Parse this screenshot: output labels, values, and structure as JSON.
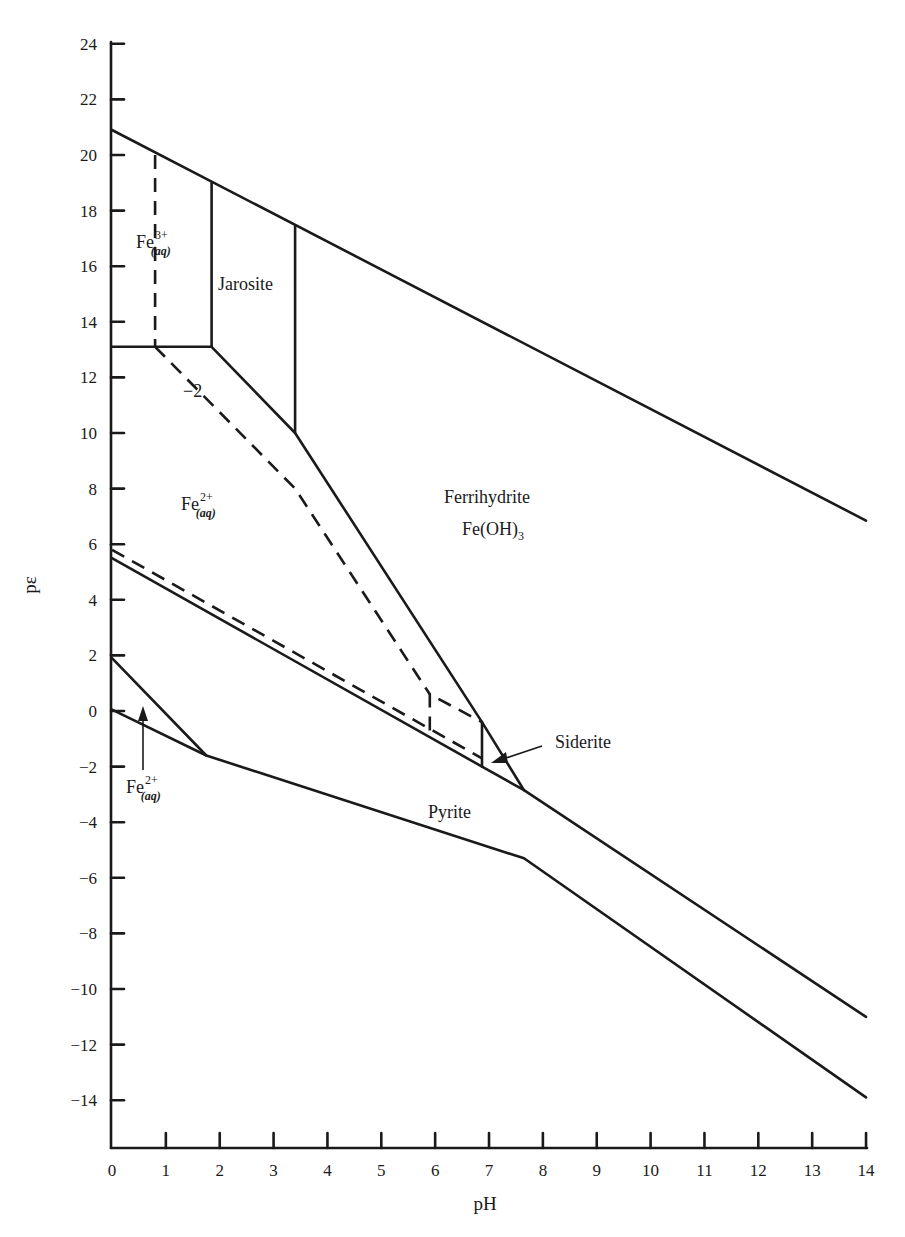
{
  "chart_data": {
    "type": "line",
    "title": "",
    "xlabel": "pH",
    "ylabel": "pε",
    "xlim": [
      0,
      14
    ],
    "ylim": [
      -16,
      24
    ],
    "x_ticks": [
      0,
      1,
      2,
      3,
      4,
      5,
      6,
      7,
      8,
      9,
      10,
      11,
      12,
      13,
      14
    ],
    "x_tick_labels": [
      "0",
      "1",
      "2",
      "3",
      "4",
      "5",
      "6",
      "7",
      "8",
      "9",
      "10",
      "11",
      "12",
      "13",
      "14"
    ],
    "y_ticks": [
      24,
      22,
      20,
      18,
      16,
      14,
      12,
      10,
      8,
      6,
      4,
      2,
      0,
      -2,
      -4,
      -6,
      -8,
      -10,
      -12,
      -14
    ],
    "y_tick_labels": [
      "24",
      "22",
      "20",
      "18",
      "16",
      "14",
      "12",
      "10",
      "8",
      "6",
      "4",
      "2",
      "0",
      "−2",
      "−4",
      "−6",
      "−8",
      "−10",
      "−12",
      "−14"
    ],
    "grid": false,
    "legend": null,
    "series": [
      {
        "name": "Upper water stability limit",
        "style": "solid",
        "x": [
          0,
          14
        ],
        "y": [
          20.9,
          6.85
        ]
      },
      {
        "name": "Lower water stability limit",
        "style": "solid",
        "x": [
          0,
          1.75,
          7.65,
          14
        ],
        "y": [
          0.05,
          -1.6,
          -5.3,
          -13.9
        ]
      },
      {
        "name": "Fe3+/Fe2+ boundary",
        "style": "solid",
        "x": [
          0,
          1.85
        ],
        "y": [
          13.1,
          13.1
        ]
      },
      {
        "name": "Fe3+/Jarosite boundary",
        "style": "solid",
        "x": [
          1.85,
          1.85
        ],
        "y": [
          19.0,
          13.1
        ]
      },
      {
        "name": "Jarosite/Ferrihydrite boundary",
        "style": "solid",
        "x": [
          3.4,
          3.4
        ],
        "y": [
          17.45,
          10.0
        ]
      },
      {
        "name": "Fe2+/Jarosite-Ferrihydrite boundary",
        "style": "solid",
        "x": [
          1.85,
          3.4,
          6.87,
          7.65
        ],
        "y": [
          13.1,
          10.0,
          -0.4,
          -2.85
        ]
      },
      {
        "name": "Fe2+/Pyrite boundary",
        "style": "solid",
        "x": [
          0,
          6.87,
          7.65,
          14
        ],
        "y": [
          5.5,
          -2.0,
          -2.85,
          -11.0
        ]
      },
      {
        "name": "Siderite boundary",
        "style": "solid",
        "x": [
          6.87,
          6.87
        ],
        "y": [
          -0.4,
          -2.0
        ]
      },
      {
        "name": "Pyrite/Fe2+ lower region",
        "style": "solid",
        "x": [
          0,
          1.75
        ],
        "y": [
          1.9,
          -1.6
        ]
      },
      {
        "name": "Fe3+ boundary (dashed, log=−2)",
        "style": "dashed",
        "x": [
          0.8,
          0.8
        ],
        "y": [
          20.0,
          13.1
        ]
      },
      {
        "name": "Fe2+/Ferrihydrite (dashed, log=−2)",
        "style": "dashed",
        "x": [
          0.8,
          3.4,
          5.9
        ],
        "y": [
          13.1,
          8.0,
          0.6
        ]
      },
      {
        "name": "Siderite dashed",
        "style": "dashed",
        "x": [
          5.9,
          5.9,
          6.87
        ],
        "y": [
          -0.7,
          0.6,
          -0.4
        ]
      },
      {
        "name": "Fe2+/Pyrite (dashed)",
        "style": "dashed",
        "x": [
          0,
          6.87
        ],
        "y": [
          5.8,
          -1.7
        ]
      }
    ],
    "annotations": [
      {
        "text": "Fe3+(aq)",
        "x": 0.75,
        "y": 16.6
      },
      {
        "text": "Jarosite",
        "x": 2.6,
        "y": 15.2
      },
      {
        "text": "−2",
        "x": 1.65,
        "y": 11.3
      },
      {
        "text": "Fe2+(aq)",
        "x": 1.85,
        "y": 7.0
      },
      {
        "text": "Ferrihydrite Fe(OH)3",
        "x": 7.5,
        "y": 7.2
      },
      {
        "text": "Siderite",
        "x": 8.5,
        "y": -1.1,
        "arrow_to": [
          7.05,
          -2.0
        ]
      },
      {
        "text": "Pyrite",
        "x": 6.3,
        "y": -3.7
      },
      {
        "text": "Fe2+(aq)",
        "x": 0.9,
        "y": -3.2,
        "arrow_to": [
          0.58,
          0.1
        ]
      }
    ]
  },
  "labels": {
    "x_axis": "pH",
    "y_axis": "pε",
    "fe3": {
      "main": "Fe",
      "sup": "3+",
      "sub": "(aq)"
    },
    "fe2_upper": {
      "main": "Fe",
      "sup": "2+",
      "sub": "(aq)"
    },
    "fe2_lower": {
      "main": "Fe",
      "sup": "2+",
      "sub": "(aq)"
    },
    "jarosite": "Jarosite",
    "minus_two": "−2",
    "ferrihydrite": "Ferrihydrite",
    "feoh3_main": "Fe(OH)",
    "feoh3_sub": "3",
    "siderite": "Siderite",
    "pyrite": "Pyrite"
  }
}
